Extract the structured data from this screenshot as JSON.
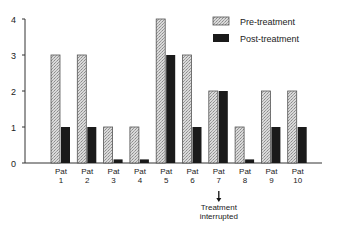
{
  "chart_data": {
    "type": "bar",
    "title": "",
    "xlabel": "",
    "ylabel": "",
    "ylim": [
      0,
      4
    ],
    "yticks": [
      0,
      1,
      2,
      3,
      4
    ],
    "grid": false,
    "legend_position": "top-right",
    "categories": [
      "Pat 1",
      "Pat 2",
      "Pat 3",
      "Pat 4",
      "Pat 5",
      "Pat 6",
      "Pat 7",
      "Pat 8",
      "Pat 9",
      "Pat 10"
    ],
    "category_lines": [
      [
        "Pat",
        "1"
      ],
      [
        "Pat",
        "2"
      ],
      [
        "Pat",
        "3"
      ],
      [
        "Pat",
        "4"
      ],
      [
        "Pat",
        "5"
      ],
      [
        "Pat",
        "6"
      ],
      [
        "Pat",
        "7"
      ],
      [
        "Pat",
        "8"
      ],
      [
        "Pat",
        "9"
      ],
      [
        "Pat",
        "10"
      ]
    ],
    "series": [
      {
        "name": "Pre-treatment",
        "pattern": "stippled-light",
        "color": "#c8c8c8",
        "values": [
          3,
          3,
          1,
          1,
          4,
          3,
          2,
          1,
          2,
          2
        ]
      },
      {
        "name": "Post-treatment",
        "pattern": "solid-dark",
        "color": "#1a1a1a",
        "values": [
          1,
          1,
          0.1,
          0.1,
          3,
          1,
          2,
          0.1,
          1,
          1
        ]
      }
    ],
    "annotations": [
      {
        "target": "Pat 7",
        "type": "arrow-up",
        "lines": [
          "Treatment",
          "interrupted"
        ]
      }
    ]
  }
}
